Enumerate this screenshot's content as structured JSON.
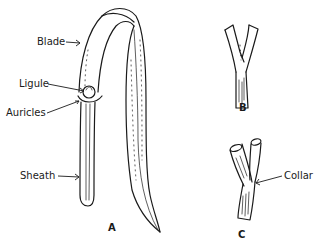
{
  "figure": {
    "panels": [
      {
        "id": "A",
        "label": "A",
        "description": "Whole leaf showing blade, ligule, auricles and sheath"
      },
      {
        "id": "B",
        "label": "B",
        "description": "Junction of blade and sheath (without prominent collar)"
      },
      {
        "id": "C",
        "label": "C",
        "description": "Junction of blade and sheath showing collar"
      }
    ],
    "labels": {
      "blade": "Blade",
      "ligule": "Ligule",
      "auricles": "Auricles",
      "sheath": "Sheath",
      "collar": "Collar"
    },
    "colors": {
      "ink": "#1a1a1a",
      "background": "#ffffff"
    }
  }
}
